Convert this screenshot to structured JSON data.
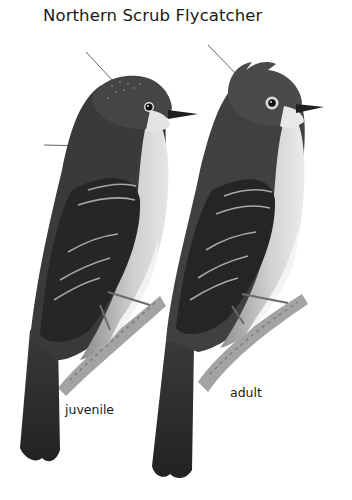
{
  "plate": {
    "title": "Northern Scrub Flycatcher",
    "labels": {
      "juvenile": "juvenile",
      "adult": "adult"
    },
    "figures": [
      {
        "id": "juvenile",
        "label": "juvenile",
        "pointer_lines": 2
      },
      {
        "id": "adult",
        "label": "adult",
        "pointer_lines": 1
      }
    ],
    "colors": {
      "background": "#ffffff",
      "text": "#1a1a1a",
      "plumage_dark": "#2e2e2e",
      "plumage_mid": "#5a5a5a",
      "breast_light": "#d6d6d6",
      "belly_white": "#f4f4f4",
      "branch": "#9a9a9a"
    }
  }
}
